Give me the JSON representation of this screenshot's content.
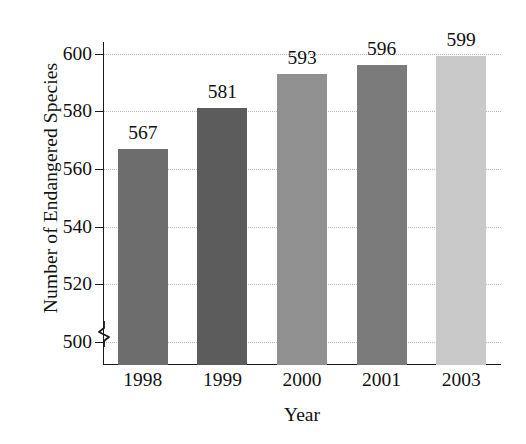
{
  "chart_data": {
    "type": "bar",
    "title": "",
    "xlabel": "Year",
    "ylabel": "Number of Endangered Species",
    "categories": [
      "1998",
      "1999",
      "2000",
      "2001",
      "2003"
    ],
    "values": [
      567,
      581,
      593,
      596,
      599
    ],
    "value_labels": [
      "567",
      "581",
      "593",
      "596",
      "599"
    ],
    "ylim": [
      492,
      604
    ],
    "yticks": [
      500,
      520,
      540,
      560,
      580,
      600
    ],
    "ytick_labels": [
      "500",
      "520",
      "540",
      "560",
      "580",
      "600"
    ],
    "grid": "horizontal-dotted",
    "axis_break": true,
    "legend": "none",
    "bar_colors": [
      "#6d6d6d",
      "#5c5c5c",
      "#919191",
      "#7b7b7b",
      "#c9c9c9"
    ],
    "grid_color": "#b9b9b9",
    "axis_color": "#1a1a1a"
  }
}
